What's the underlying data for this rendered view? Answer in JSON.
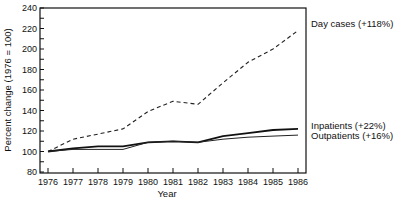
{
  "chart_data": {
    "type": "line",
    "title": "",
    "xlabel": "Year",
    "ylabel": "Percent change (1976 = 100)",
    "x": [
      1976,
      1977,
      1978,
      1979,
      1980,
      1981,
      1982,
      1983,
      1984,
      1985,
      1986
    ],
    "xticks": [
      "1976",
      "1977",
      "1978",
      "1979",
      "1980",
      "1981",
      "1982",
      "1983",
      "1984",
      "1985",
      "1986"
    ],
    "yticks": [
      80,
      100,
      120,
      140,
      160,
      180,
      200,
      220,
      240
    ],
    "ylim": [
      80,
      240
    ],
    "grid": false,
    "legend_position": "inline-right",
    "series": [
      {
        "name": "Day cases",
        "label": "Day cases (+118%)",
        "style": "dashed",
        "values": [
          100,
          112,
          117,
          122,
          139,
          149,
          146,
          167,
          187,
          200,
          218
        ]
      },
      {
        "name": "Inpatients",
        "label": "Inpatients (+22%)",
        "style": "solid-thick",
        "values": [
          100,
          103,
          105,
          105,
          109,
          110,
          109,
          115,
          118,
          121,
          122
        ]
      },
      {
        "name": "Outpatients",
        "label": "Outpatients (+16%)",
        "style": "solid-thin",
        "values": [
          100,
          102,
          102,
          102,
          109,
          110,
          109,
          112,
          114,
          115,
          116
        ]
      }
    ]
  }
}
